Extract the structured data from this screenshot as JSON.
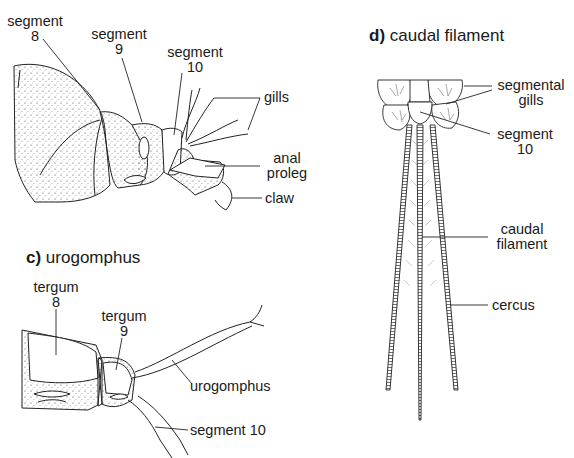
{
  "panel_b": {
    "labels": {
      "segment8": [
        "segment",
        "8"
      ],
      "segment9": [
        "segment",
        "9"
      ],
      "segment10": [
        "segment",
        "10"
      ],
      "gills": "gills",
      "anal_proleg": [
        "anal",
        "proleg"
      ],
      "claw": "claw"
    }
  },
  "panel_c": {
    "letter": "c)",
    "title": "urogomphus",
    "labels": {
      "tergum8": [
        "tergum",
        "8"
      ],
      "tergum9": [
        "tergum",
        "9"
      ],
      "urogomphus": "urogomphus",
      "segment10": "segment 10"
    }
  },
  "panel_d": {
    "letter": "d)",
    "title": "caudal filament",
    "labels": {
      "segmental_gills": [
        "segmental",
        "gills"
      ],
      "segment10": [
        "segment",
        "10"
      ],
      "caudal_filament": [
        "caudal",
        "filament"
      ],
      "cercus": "cercus"
    }
  }
}
